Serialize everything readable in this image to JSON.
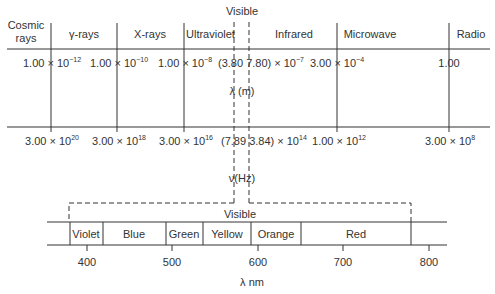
{
  "top_header": "Visible",
  "regions": [
    {
      "label": "Cosmic rays",
      "line1": "Cosmic",
      "line2": "rays"
    },
    {
      "label": "γ-rays"
    },
    {
      "label": "X-rays"
    },
    {
      "label": "Ultraviolet"
    },
    {
      "label": "Infrared"
    },
    {
      "label": "Microwave"
    },
    {
      "label": "Radio"
    }
  ],
  "wavelength_axis": {
    "label": "λ (m)",
    "ticks": [
      {
        "mantissa": "1.00 × 10",
        "exp": "−12"
      },
      {
        "mantissa": "1.00 × 10",
        "exp": "−10"
      },
      {
        "mantissa": "1.00 × 10",
        "exp": "−8"
      },
      {
        "mantissa": "(3.80  7.80) × 10",
        "exp": "−7"
      },
      {
        "mantissa": "3.00 × 10",
        "exp": "−4"
      },
      {
        "mantissa": "1.00",
        "exp": ""
      }
    ]
  },
  "frequency_axis": {
    "label": "ν(Hz)",
    "ticks": [
      {
        "mantissa": "3.00 × 10",
        "exp": "20"
      },
      {
        "mantissa": "3.00 × 10",
        "exp": "18"
      },
      {
        "mantissa": "3.00 × 10",
        "exp": "16"
      },
      {
        "mantissa": "(7.89  3.84) × 10",
        "exp": "14"
      },
      {
        "mantissa": "1.00 × 10",
        "exp": "12"
      },
      {
        "mantissa": "3.00 × 10",
        "exp": "8"
      }
    ]
  },
  "visible_band": {
    "title": "Visible",
    "colors": [
      "Violet",
      "Blue",
      "Green",
      "Yellow",
      "Orange",
      "Red"
    ],
    "ticks": [
      "400",
      "500",
      "600",
      "700",
      "800"
    ],
    "axis_label": "λ nm"
  }
}
